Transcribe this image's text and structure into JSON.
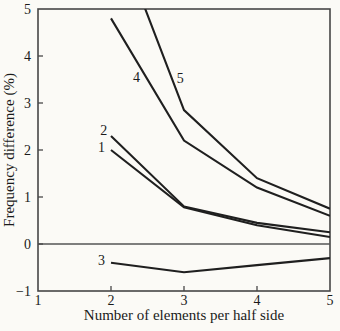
{
  "figure": {
    "background": "#fbfaf6",
    "line_color": "#1f1f1f",
    "axis_color": "#474747",
    "zero_line_color": "#555555",
    "text_color": "#1a1a1a"
  },
  "chart_data": {
    "type": "line",
    "title": "",
    "xlabel": "Number of elements per half side",
    "ylabel": "Frequency difference (%)",
    "xlim": [
      1,
      5
    ],
    "ylim": [
      -1,
      5
    ],
    "x_ticks": [
      1,
      2,
      3,
      4,
      5
    ],
    "y_ticks": [
      -1,
      0,
      1,
      2,
      3,
      4,
      5
    ],
    "grid": false,
    "zero_line": 0,
    "legend": "none (curves labeled inline with numbers)",
    "x": [
      2,
      3,
      4,
      5
    ],
    "series": [
      {
        "name": "1",
        "values": [
          2.0,
          0.78,
          0.4,
          0.15
        ],
        "label_pos": [
          1.87,
          2.05
        ]
      },
      {
        "name": "2",
        "values": [
          2.3,
          0.8,
          0.45,
          0.25
        ],
        "label_pos": [
          1.9,
          2.42
        ]
      },
      {
        "name": "3",
        "values": [
          -0.4,
          -0.6,
          -0.45,
          -0.3
        ],
        "label_pos": [
          1.87,
          -0.35
        ]
      },
      {
        "name": "4",
        "values": [
          4.8,
          2.2,
          1.2,
          0.6
        ],
        "label_pos": [
          2.35,
          3.55
        ]
      },
      {
        "name": "5",
        "values": [
          6.9,
          2.85,
          1.4,
          0.75
        ],
        "label_pos": [
          2.95,
          3.52
        ]
      }
    ]
  }
}
